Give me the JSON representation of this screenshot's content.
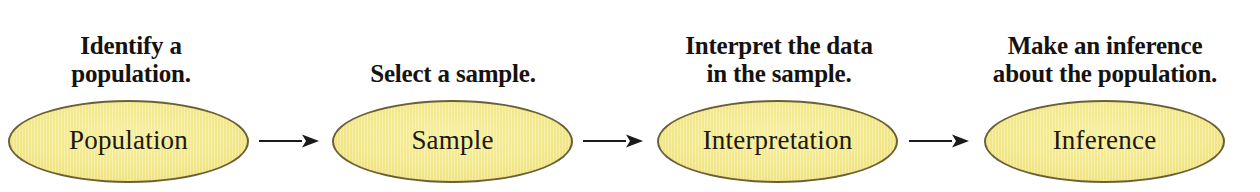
{
  "diagram": {
    "background_color": "#ffffff",
    "node_fill_color": "#f3e88b",
    "node_border_color": "#6b6035",
    "node_text_color": "#20180d",
    "caption_text_color": "#16120f",
    "arrow_color": "#1a1a1a",
    "steps": [
      {
        "caption_lines": [
          "Identify a",
          "population."
        ],
        "node_label": "Population",
        "arrow_icon": "arrow-right-icon"
      },
      {
        "caption_lines": [
          "Select a sample."
        ],
        "node_label": "Sample",
        "arrow_icon": "arrow-right-icon"
      },
      {
        "caption_lines": [
          "Interpret the data",
          "in the sample."
        ],
        "node_label": "Interpretation",
        "arrow_icon": "arrow-right-icon"
      },
      {
        "caption_lines": [
          "Make an inference",
          "about the population."
        ],
        "node_label": "Inference",
        "arrow_icon": null
      }
    ]
  }
}
